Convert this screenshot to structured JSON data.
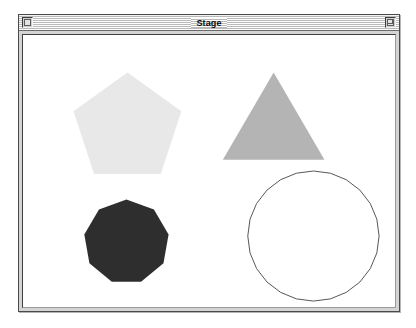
{
  "window": {
    "title": "Stage",
    "close_box_name": "close-box-icon",
    "zoom_box_name": "zoom-box-icon"
  },
  "stage": {
    "background_color": "#ffffff",
    "shapes": [
      {
        "name": "pentagon",
        "sides": 5,
        "fill": "#e8e8e8",
        "stroke": "none",
        "center_x": 109,
        "center_y": 114,
        "radius": 57,
        "rotation_deg": -90
      },
      {
        "name": "triangle",
        "sides": 3,
        "fill": "#b4b4b4",
        "stroke": "none",
        "center_x": 256,
        "center_y": 116,
        "radius": 59,
        "rotation_deg": -90
      },
      {
        "name": "nonagon",
        "sides": 9,
        "fill": "#2e2e2e",
        "stroke": "none",
        "center_x": 108,
        "center_y": 229,
        "radius": 43,
        "rotation_deg": -90
      },
      {
        "name": "circle",
        "sides": 24,
        "fill": "none",
        "stroke": "#555555",
        "stroke_width": 1,
        "center_x": 296,
        "center_y": 223,
        "radius": 66,
        "rotation_deg": -90
      }
    ]
  }
}
